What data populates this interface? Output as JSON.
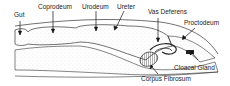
{
  "diagram": {
    "labels": {
      "gut": "Gut",
      "coprodeum": "Coprodeum",
      "urodeum": "Urodeum",
      "ureter": "Ureter",
      "vas_deferens": "Vas Deferens",
      "proctodeum": "Proctodeum",
      "cloacal_gland": "Cloacal Gland",
      "corpus_fibrosum": "Corpus Fibrosum"
    },
    "colors": {
      "line": "#222222",
      "stipple": "#9a9a9a",
      "background": "#ffffff"
    }
  }
}
